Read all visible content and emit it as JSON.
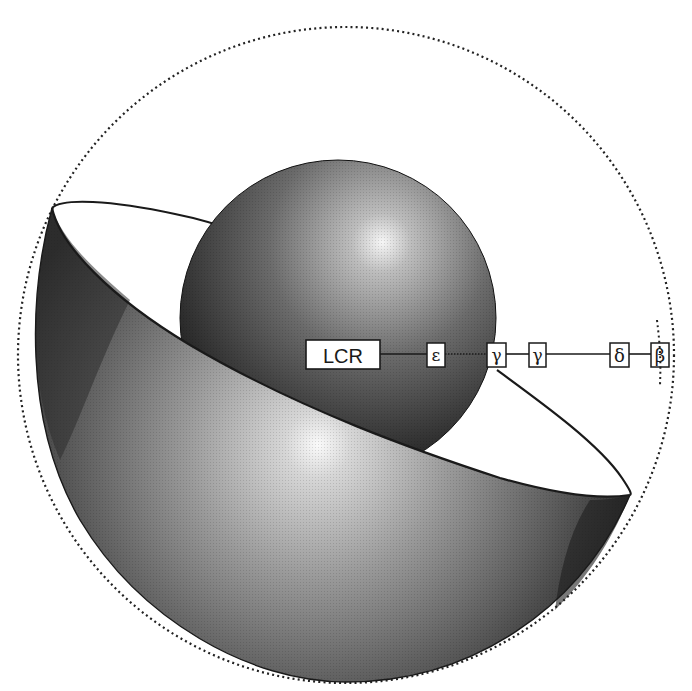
{
  "diagram": {
    "type": "gene-locus-schematic",
    "colors": {
      "background": "#ffffff",
      "outline": "#1a1a1a",
      "sphere_dark": "#141414",
      "sphere_highlight": "#f4f4f4",
      "bowl_dark": "#2a2a2a",
      "bowl_highlight": "#fafafa",
      "box_fill": "#ffffff"
    },
    "shapes": {
      "outer_circle": {
        "style": "dotted",
        "cx": 346,
        "cy": 355,
        "r": 328
      },
      "inner_sphere": {
        "cx": 338,
        "cy": 318,
        "r": 158
      },
      "bowl": {
        "style": "shaded-hemisphere-cutaway"
      }
    },
    "chain": {
      "nodes": [
        {
          "id": "lcr",
          "label": "LCR"
        },
        {
          "id": "epsilon",
          "label": "ε"
        },
        {
          "id": "gamma-g",
          "label": "γ"
        },
        {
          "id": "gamma-a",
          "label": "γ"
        },
        {
          "id": "delta",
          "label": "δ"
        },
        {
          "id": "beta",
          "label": "β"
        }
      ]
    }
  }
}
